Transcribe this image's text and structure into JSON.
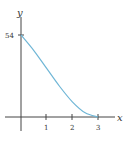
{
  "chart_data": {
    "type": "line",
    "title": "",
    "xlabel": "x",
    "ylabel": "y",
    "x_ticks": [
      "1",
      "2",
      "3"
    ],
    "y_ticks": [
      "54"
    ],
    "xlim": [
      -0.6,
      3.6
    ],
    "ylim": [
      -10,
      62
    ],
    "grid": false,
    "legend": null,
    "series": [
      {
        "name": "curve",
        "color": "#6fb6d6",
        "x": [
          0,
          0.5,
          1,
          1.5,
          2,
          2.5,
          3
        ],
        "y": [
          54,
          43.75,
          32,
          20.25,
          10,
          2.75,
          0
        ]
      }
    ]
  },
  "labels": {
    "y_axis": "y",
    "x_axis": "x",
    "y_tick_54": "54",
    "x_tick_1": "1",
    "x_tick_2": "2",
    "x_tick_3": "3"
  }
}
